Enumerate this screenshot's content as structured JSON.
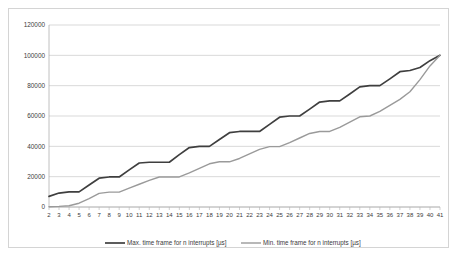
{
  "chart_data": {
    "type": "line",
    "title": "",
    "xlabel": "",
    "ylabel": "",
    "xlim": [
      2,
      41
    ],
    "ylim": [
      0,
      120000
    ],
    "grid": true,
    "legend_position": "bottom",
    "ytick_labels": [
      "0",
      "20000",
      "40000",
      "60000",
      "80000",
      "100000",
      "120000"
    ],
    "ytick_values": [
      0,
      20000,
      40000,
      60000,
      80000,
      100000,
      120000
    ],
    "categories": [
      2,
      3,
      4,
      5,
      6,
      7,
      8,
      9,
      10,
      11,
      12,
      13,
      14,
      15,
      16,
      17,
      18,
      19,
      20,
      21,
      22,
      23,
      24,
      25,
      26,
      27,
      28,
      29,
      30,
      31,
      32,
      33,
      34,
      35,
      36,
      37,
      38,
      39,
      40,
      41
    ],
    "xtick_labels": [
      "2",
      "3",
      "4",
      "5",
      "6",
      "7",
      "8",
      "9",
      "10",
      "11",
      "12",
      "13",
      "14",
      "15",
      "16",
      "17",
      "18",
      "19",
      "20",
      "21",
      "22",
      "23",
      "24",
      "25",
      "26",
      "27",
      "28",
      "29",
      "30",
      "31",
      "32",
      "33",
      "34",
      "35",
      "36",
      "37",
      "38",
      "39",
      "40",
      "41"
    ],
    "series": [
      {
        "name": "Max. time frame for n interrupts [µs]",
        "color": "#3f3f3f",
        "values": [
          7000,
          9200,
          10000,
          10000,
          14500,
          19000,
          19800,
          19800,
          24500,
          29000,
          29500,
          29500,
          29500,
          34500,
          39200,
          40000,
          40000,
          44500,
          49000,
          49800,
          49800,
          49800,
          54500,
          59200,
          60000,
          60000,
          64500,
          69200,
          70000,
          70000,
          74500,
          79200,
          80000,
          80000,
          84500,
          89200,
          90000,
          92000,
          96500,
          100000
        ]
      },
      {
        "name": "Min. time frame for n interrupts [µs]",
        "color": "#9a9a9a",
        "values": [
          200,
          400,
          800,
          2500,
          5500,
          9000,
          9800,
          9800,
          12500,
          15000,
          17500,
          19800,
          19800,
          19800,
          22500,
          25500,
          28500,
          29800,
          29800,
          32000,
          35000,
          38000,
          39800,
          39800,
          42500,
          45500,
          48500,
          49800,
          49800,
          52500,
          56000,
          59500,
          60000,
          63000,
          67000,
          71000,
          76000,
          84000,
          93000,
          100000
        ]
      }
    ]
  },
  "legend": {
    "items": [
      {
        "label": "Max. time frame for n interrupts [µs]"
      },
      {
        "label": "Min. time frame for n interrupts [µs]"
      }
    ]
  }
}
